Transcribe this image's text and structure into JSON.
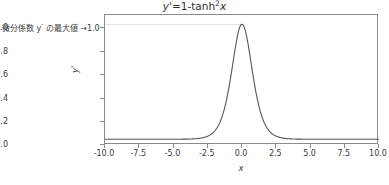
{
  "chart_data": {
    "type": "line",
    "title_parts": {
      "lhs": "y'",
      "eq": "=1-tanh",
      "exp": "2",
      "var": "x"
    },
    "xlabel": "x",
    "ylabel": "y'",
    "xlim": [
      -10.0,
      10.0
    ],
    "ylim": [
      -0.05,
      1.08
    ],
    "grid": false,
    "legend": null,
    "line_color": "#555555",
    "frame_color": "#8a8a8a",
    "reference_line": {
      "y": 1.0,
      "color": "#e4e4e4",
      "label": "微分係数 y′ の最大値 →1.0"
    },
    "xticks": [
      "-10.0",
      "-7.5",
      "-5.0",
      "-2.5",
      "0.0",
      "2.5",
      "5.0",
      "7.5",
      "10.0"
    ],
    "xtick_values": [
      -10.0,
      -7.5,
      -5.0,
      -2.5,
      0.0,
      2.5,
      5.0,
      7.5,
      10.0
    ],
    "yticks": [
      "0.0",
      "0.2",
      "0.4",
      "0.6",
      "0.8",
      "1.0"
    ],
    "ytick_values": [
      0.0,
      0.2,
      0.4,
      0.6,
      0.8,
      1.0
    ],
    "series": [
      {
        "name": "y'=1-tanh²x",
        "x": [
          -10.0,
          -9.5,
          -9.0,
          -8.5,
          -8.0,
          -7.5,
          -7.0,
          -6.5,
          -6.0,
          -5.5,
          -5.0,
          -4.75,
          -4.5,
          -4.25,
          -4.0,
          -3.75,
          -3.5,
          -3.25,
          -3.0,
          -2.75,
          -2.5,
          -2.25,
          -2.0,
          -1.75,
          -1.5,
          -1.25,
          -1.0,
          -0.875,
          -0.75,
          -0.625,
          -0.5,
          -0.375,
          -0.25,
          -0.125,
          0.0,
          0.125,
          0.25,
          0.375,
          0.5,
          0.625,
          0.75,
          0.875,
          1.0,
          1.25,
          1.5,
          1.75,
          2.0,
          2.25,
          2.5,
          2.75,
          3.0,
          3.25,
          3.5,
          3.75,
          4.0,
          4.25,
          4.5,
          4.75,
          5.0,
          5.5,
          6.0,
          6.5,
          7.0,
          7.5,
          8.0,
          8.5,
          9.0,
          9.5,
          10.0
        ],
        "y": [
          0.0,
          0.0,
          0.0,
          0.0,
          0.0,
          0.0,
          0.0,
          0.0,
          0.0,
          0.0,
          0.0002,
          0.0003,
          0.0005,
          0.0008,
          0.0013,
          0.0022,
          0.0036,
          0.0059,
          0.0099,
          0.0163,
          0.0268,
          0.0439,
          0.0707,
          0.1118,
          0.171,
          0.25,
          0.42,
          0.5,
          0.581,
          0.661,
          0.7359,
          0.8034,
          0.8601,
          0.9038,
          1.0,
          0.9038,
          0.8601,
          0.8034,
          0.7359,
          0.661,
          0.581,
          0.5,
          0.42,
          0.25,
          0.171,
          0.1118,
          0.0707,
          0.0439,
          0.0268,
          0.0163,
          0.0099,
          0.0059,
          0.0036,
          0.0022,
          0.0013,
          0.0008,
          0.0005,
          0.0003,
          0.0002,
          0.0,
          0.0,
          0.0,
          0.0,
          0.0,
          0.0,
          0.0,
          0.0,
          0.0,
          0.0
        ],
        "peak": {
          "x": 0.0,
          "y": 1.0
        }
      }
    ]
  },
  "annotation": {
    "text": "微分係数 y′ の最大値 →1.0"
  }
}
